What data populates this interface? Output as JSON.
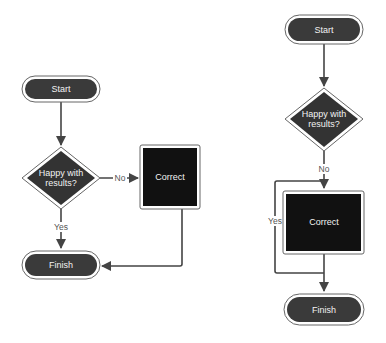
{
  "colors": {
    "node_fill": "#3a3a3a",
    "process_fill": "#111111",
    "node_border": "#555555",
    "edge": "#444444",
    "background": "#ffffff"
  },
  "diagrams": [
    {
      "name": "left-flowchart",
      "nodes": {
        "start": {
          "type": "terminator",
          "label": "Start"
        },
        "decision": {
          "type": "decision",
          "label_line1": "Happy with",
          "label_line2": "results?"
        },
        "correct": {
          "type": "process",
          "label": "Correct"
        },
        "finish": {
          "type": "terminator",
          "label": "Finish"
        }
      },
      "edges": [
        {
          "from": "start",
          "to": "decision",
          "label": ""
        },
        {
          "from": "decision",
          "to": "correct",
          "label": "No"
        },
        {
          "from": "decision",
          "to": "finish",
          "label": "Yes"
        },
        {
          "from": "correct",
          "to": "finish",
          "label": ""
        }
      ]
    },
    {
      "name": "right-flowchart",
      "nodes": {
        "start": {
          "type": "terminator",
          "label": "Start"
        },
        "decision": {
          "type": "decision",
          "label_line1": "Happy with",
          "label_line2": "results?"
        },
        "correct": {
          "type": "process",
          "label": "Correct"
        },
        "finish": {
          "type": "terminator",
          "label": "Finish"
        }
      },
      "edges": [
        {
          "from": "start",
          "to": "decision",
          "label": ""
        },
        {
          "from": "decision",
          "to": "correct",
          "label": "No"
        },
        {
          "from": "decision",
          "to": "finish",
          "label": "Yes"
        },
        {
          "from": "correct",
          "to": "finish",
          "label": ""
        }
      ]
    }
  ]
}
